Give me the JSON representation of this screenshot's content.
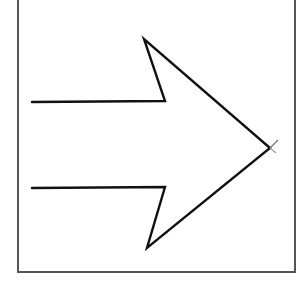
{
  "diagram": {
    "type": "hand-drawn-sketch",
    "direction": "right",
    "stroke_color": "#111111",
    "frame_color": "#555555",
    "background": "#ffffff",
    "arrow_points": [
      [
        32,
        102
      ],
      [
        165,
        101
      ],
      [
        144,
        39
      ],
      [
        270,
        148
      ],
      [
        147,
        248
      ],
      [
        165,
        187
      ],
      [
        32,
        188
      ]
    ],
    "tip_overshoot": [
      [
        [
          270,
          148
        ],
        [
          278,
          140
        ]
      ],
      [
        [
          270,
          148
        ],
        [
          276,
          153
        ]
      ]
    ]
  }
}
